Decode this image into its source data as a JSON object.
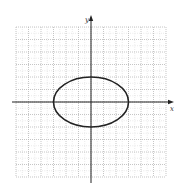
{
  "chart_data": {
    "type": "line",
    "title": "",
    "xlabel": "x",
    "ylabel": "y",
    "xlim": [
      -6,
      6
    ],
    "ylim": [
      -6,
      6
    ],
    "grid": true,
    "grid_major_step": 1,
    "grid_minor_step": 0.5,
    "grid_style": "dotted",
    "series": [
      {
        "name": "ellipse",
        "equation": "x^2/9 + y^2/4 = 1",
        "center": [
          0,
          0
        ],
        "semi_major_x": 3,
        "semi_minor_y": 2,
        "color": "#222222"
      }
    ]
  },
  "axes": {
    "x_label": "x",
    "y_label": "y"
  },
  "colors": {
    "grid": "#b8b8b8",
    "axis": "#222222",
    "curve": "#222222"
  }
}
